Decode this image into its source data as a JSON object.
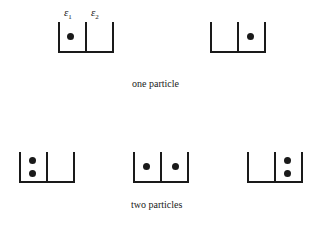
{
  "diagram": {
    "level_labels": {
      "e1": "ε",
      "e1_sub": "1",
      "e2": "ε",
      "e2_sub": "2"
    },
    "sections": [
      {
        "caption": "one particle",
        "configurations": [
          {
            "level1_particles": 1,
            "level2_particles": 0
          },
          {
            "level1_particles": 0,
            "level2_particles": 1
          }
        ]
      },
      {
        "caption": "two particles",
        "configurations": [
          {
            "level1_particles": 2,
            "level2_particles": 0
          },
          {
            "level1_particles": 1,
            "level2_particles": 1
          },
          {
            "level1_particles": 0,
            "level2_particles": 2
          }
        ]
      }
    ]
  }
}
